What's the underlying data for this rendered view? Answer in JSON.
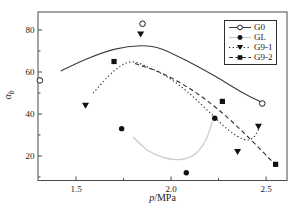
{
  "chart_data": {
    "type": "scatter",
    "title": "",
    "xlabel": "p/MPa",
    "ylabel": "αb",
    "axis_labels": {
      "x_var": "p",
      "x_rest": "/MPa",
      "y_var": "α",
      "y_sub": "b"
    },
    "xlim": [
      1.3,
      2.61
    ],
    "ylim": [
      8.3,
      88.6
    ],
    "x_tick_values": [
      1.5,
      2.0,
      2.5
    ],
    "x_tick_labels": [
      "1.5",
      "2.0",
      "2.5"
    ],
    "x_minor_ticks": [
      1.75,
      2.25
    ],
    "y_tick_values": [
      20,
      40,
      60,
      80
    ],
    "y_tick_labels": [
      "20",
      "40",
      "60",
      "80"
    ],
    "y_minor_ticks": [
      10,
      30,
      50,
      70
    ],
    "grid": false,
    "legend_position": "top-right",
    "frame_color": "#4a4a4a",
    "series": [
      {
        "name": "G0",
        "marker": "open-circle",
        "line": "solid",
        "line_color": "#3c3c3c",
        "marker_color": "#1a1a1a",
        "points": [
          [
            1.31,
            56
          ],
          [
            1.85,
            83
          ],
          [
            2.48,
            45
          ]
        ],
        "fit": [
          [
            1.42,
            60.5
          ],
          [
            1.55,
            66
          ],
          [
            1.7,
            70.8
          ],
          [
            1.84,
            72.5
          ],
          [
            1.95,
            71
          ],
          [
            2.1,
            64.5
          ],
          [
            2.25,
            57
          ],
          [
            2.38,
            50
          ],
          [
            2.48,
            45.4
          ]
        ]
      },
      {
        "name": "GL",
        "marker": "filled-circle",
        "line": "solid",
        "line_color": "#cccccc",
        "marker_color": "#111111",
        "points": [
          [
            1.74,
            33
          ],
          [
            2.08,
            12
          ],
          [
            2.23,
            38
          ]
        ],
        "fit": [
          [
            1.8,
            29
          ],
          [
            1.88,
            22.5
          ],
          [
            1.97,
            19
          ],
          [
            2.05,
            18.3
          ],
          [
            2.12,
            20.5
          ],
          [
            2.18,
            27
          ],
          [
            2.22,
            37
          ]
        ]
      },
      {
        "name": "G9-1",
        "marker": "filled-triangle-down",
        "line": "dotted",
        "line_color": "#2e2e2e",
        "marker_color": "#111111",
        "points": [
          [
            1.55,
            44
          ],
          [
            1.84,
            78
          ],
          [
            2.35,
            22
          ],
          [
            2.46,
            34
          ]
        ],
        "fit": [
          [
            1.59,
            50
          ],
          [
            1.7,
            60.5
          ],
          [
            1.79,
            64.8
          ],
          [
            1.9,
            61.5
          ],
          [
            2.0,
            56.5
          ],
          [
            2.1,
            49.5
          ],
          [
            2.2,
            41
          ],
          [
            2.3,
            32.5
          ],
          [
            2.38,
            28
          ],
          [
            2.43,
            28.5
          ],
          [
            2.465,
            33.5
          ]
        ]
      },
      {
        "name": "G9-2",
        "marker": "filled-square",
        "line": "dashed",
        "line_color": "#2e2e2e",
        "marker_color": "#111111",
        "points": [
          [
            1.7,
            65
          ],
          [
            2.27,
            46
          ],
          [
            2.55,
            16
          ]
        ],
        "fit": [
          [
            1.81,
            64
          ],
          [
            1.95,
            59.5
          ],
          [
            2.1,
            52
          ],
          [
            2.25,
            42
          ],
          [
            2.4,
            29.5
          ],
          [
            2.55,
            15.7
          ]
        ]
      }
    ]
  }
}
